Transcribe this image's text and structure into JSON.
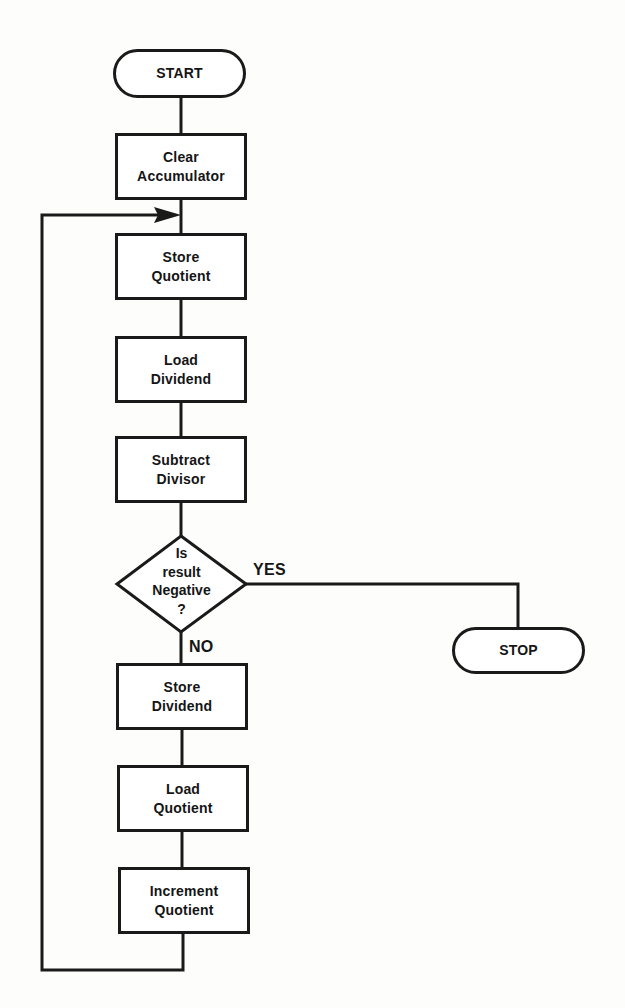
{
  "diagram": {
    "type": "flowchart",
    "nodes": {
      "start": {
        "label": "START",
        "shape": "terminator"
      },
      "clear_accumulator": {
        "line1": "Clear",
        "line2": "Accumulator",
        "shape": "process"
      },
      "store_quotient": {
        "line1": "Store",
        "line2": "Quotient",
        "shape": "process"
      },
      "load_dividend": {
        "line1": "Load",
        "line2": "Dividend",
        "shape": "process"
      },
      "subtract_divisor": {
        "line1": "Subtract",
        "line2": "Divisor",
        "shape": "process"
      },
      "decision": {
        "line1": "Is",
        "line2": "result",
        "line3": "Negative",
        "line4": "?",
        "shape": "decision"
      },
      "store_dividend": {
        "line1": "Store",
        "line2": "Dividend",
        "shape": "process"
      },
      "load_quotient": {
        "line1": "Load",
        "line2": "Quotient",
        "shape": "process"
      },
      "increment_quotient": {
        "line1": "Increment",
        "line2": "Quotient",
        "shape": "process"
      },
      "stop": {
        "label": "STOP",
        "shape": "terminator"
      }
    },
    "edge_labels": {
      "yes": "YES",
      "no": "NO"
    },
    "edges": [
      {
        "from": "START",
        "to": "Clear Accumulator"
      },
      {
        "from": "Clear Accumulator",
        "to": "Store Quotient"
      },
      {
        "from": "Store Quotient",
        "to": "Load Dividend"
      },
      {
        "from": "Load Dividend",
        "to": "Subtract Divisor"
      },
      {
        "from": "Subtract Divisor",
        "to": "Is result Negative ?"
      },
      {
        "from": "Is result Negative ?",
        "to": "STOP",
        "label": "YES"
      },
      {
        "from": "Is result Negative ?",
        "to": "Store Dividend",
        "label": "NO"
      },
      {
        "from": "Store Dividend",
        "to": "Load Quotient"
      },
      {
        "from": "Load Quotient",
        "to": "Increment Quotient"
      },
      {
        "from": "Increment Quotient",
        "to": "Store Quotient",
        "label": "loop"
      }
    ],
    "colors": {
      "stroke": "#1a1a1a",
      "background": "#fdfdfc"
    }
  }
}
